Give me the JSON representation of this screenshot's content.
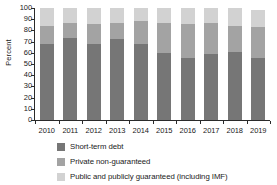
{
  "chart_data": {
    "type": "bar",
    "stacked": true,
    "title": "",
    "xlabel": "",
    "ylabel": "Percent",
    "ylim": [
      0,
      100
    ],
    "yticks": [
      0,
      10,
      20,
      30,
      40,
      50,
      60,
      70,
      80,
      90,
      100
    ],
    "ytick_labels": [
      "0",
      "10",
      "20",
      "30",
      "40",
      "50",
      "60",
      "70",
      "80",
      "90",
      "100"
    ],
    "grid": false,
    "legend_position": "bottom",
    "categories": [
      "2010",
      "2011",
      "2012",
      "2013",
      "2014",
      "2015",
      "2016",
      "2017",
      "2018",
      "2019"
    ],
    "series": [
      {
        "name": "Short-term debt",
        "color": "#767676",
        "values": [
          68,
          73,
          68,
          72,
          68,
          60,
          55,
          59,
          61,
          55
        ]
      },
      {
        "name": "Private non-guaranteed",
        "color": "#a3a3a3",
        "values": [
          16,
          14,
          18,
          15,
          20,
          27,
          31,
          28,
          23,
          28
        ]
      },
      {
        "name": "Public and publicly guaranteed (including IMF)",
        "color": "#d2d2d2",
        "values": [
          16,
          13,
          14,
          13,
          12,
          13,
          14,
          13,
          16,
          15
        ]
      }
    ],
    "totals": [
      100,
      100,
      100,
      100,
      100,
      100,
      100,
      100,
      100,
      98
    ],
    "cumulative_tops": {
      "short_term_debt": [
        68,
        73,
        68,
        72,
        68,
        60,
        55,
        59,
        61,
        55
      ],
      "private_non_guaranteed": [
        84,
        87,
        86,
        87,
        88,
        87,
        86,
        87,
        84,
        83
      ],
      "public_and_publicly_guaranteed": [
        100,
        100,
        100,
        100,
        100,
        100,
        100,
        100,
        100,
        98
      ]
    }
  },
  "axis": {
    "y_title": "Percent"
  },
  "legend": {
    "items": [
      {
        "label": "Short-term debt",
        "color": "#767676"
      },
      {
        "label": "Private non-guaranteed",
        "color": "#a3a3a3"
      },
      {
        "label": "Public and publicly guaranteed (including IMF)",
        "color": "#d2d2d2"
      }
    ]
  }
}
